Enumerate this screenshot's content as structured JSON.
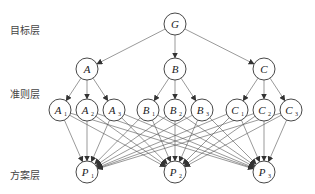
{
  "layers": {
    "goal": "目标层",
    "criteria": "准则层",
    "alternatives": "方案层"
  },
  "nodes": {
    "goal": [
      {
        "id": "G",
        "label": "G",
        "sub": "",
        "x": 175,
        "y": 24
      }
    ],
    "criteria": [
      {
        "id": "A",
        "label": "A",
        "sub": "",
        "x": 87,
        "y": 69
      },
      {
        "id": "B",
        "label": "B",
        "sub": "",
        "x": 175,
        "y": 69
      },
      {
        "id": "C",
        "label": "C",
        "sub": "",
        "x": 264,
        "y": 69
      }
    ],
    "subcriteria": [
      {
        "id": "A1",
        "label": "A",
        "sub": "1",
        "x": 60,
        "y": 110,
        "parent": "A"
      },
      {
        "id": "A2",
        "label": "A",
        "sub": "2",
        "x": 87,
        "y": 110,
        "parent": "A"
      },
      {
        "id": "A3",
        "label": "A",
        "sub": "3",
        "x": 114,
        "y": 110,
        "parent": "A"
      },
      {
        "id": "B1",
        "label": "B",
        "sub": "1",
        "x": 148,
        "y": 110,
        "parent": "B"
      },
      {
        "id": "B2",
        "label": "B",
        "sub": "2",
        "x": 175,
        "y": 110,
        "parent": "B"
      },
      {
        "id": "B3",
        "label": "B",
        "sub": "3",
        "x": 202,
        "y": 110,
        "parent": "B"
      },
      {
        "id": "C1",
        "label": "C",
        "sub": "1",
        "x": 237,
        "y": 110,
        "parent": "C"
      },
      {
        "id": "C2",
        "label": "C",
        "sub": "2",
        "x": 264,
        "y": 110,
        "parent": "C"
      },
      {
        "id": "C3",
        "label": "C",
        "sub": "3",
        "x": 291,
        "y": 110,
        "parent": "C"
      }
    ],
    "alternatives": [
      {
        "id": "P1",
        "label": "P",
        "sub": "1",
        "x": 87,
        "y": 172
      },
      {
        "id": "P2",
        "label": "P",
        "sub": "2",
        "x": 175,
        "y": 172
      },
      {
        "id": "P3",
        "label": "P",
        "sub": "3",
        "x": 264,
        "y": 172
      }
    ]
  },
  "style": {
    "radius": 11,
    "stroke": "#333333",
    "edge": "#555555"
  }
}
